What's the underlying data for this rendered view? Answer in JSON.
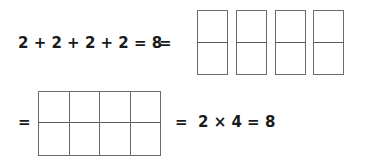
{
  "top_row": {
    "equation": "2 + 2 + 2 + 2 = 8",
    "equals": "=",
    "boxes": [
      {
        "rows": 2,
        "cols": 1
      },
      {
        "rows": 2,
        "cols": 1
      },
      {
        "rows": 2,
        "cols": 1
      },
      {
        "rows": 2,
        "cols": 1
      }
    ]
  },
  "bottom_row": {
    "equals": "=",
    "grid": {
      "rows": 2,
      "cols": 4
    },
    "result": "=  2 × 4 = 8"
  },
  "colors": {
    "text": "#1a1a1a",
    "lines": "#6b6b6b",
    "background": "#ffffff"
  }
}
